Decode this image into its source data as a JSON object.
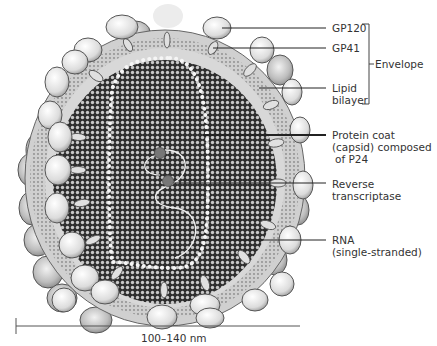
{
  "diagram": {
    "labels": {
      "gp120": "GP120",
      "gp41": "GP41",
      "lipid_line1": "Lipid",
      "lipid_line2": "bilayer",
      "envelope": "Envelope",
      "capsid_line1": "Protein coat",
      "capsid_line2": "(capsid) composed",
      "capsid_line3": "of P24",
      "rt_line1": "Reverse",
      "rt_line2": "transcriptase",
      "rna_line1": "RNA",
      "rna_line2": "(single-stranded)"
    },
    "scale": {
      "label": "100–140 nm"
    },
    "colors": {
      "knob_fill": "#e4e4e4",
      "knob_stroke": "#555555",
      "matrix": "#cfcfcf",
      "lipid": "#bdbdbd",
      "capsid_dark": "#3a3a3a",
      "capsid_light": "#bbbbbb",
      "text": "#333333"
    }
  }
}
